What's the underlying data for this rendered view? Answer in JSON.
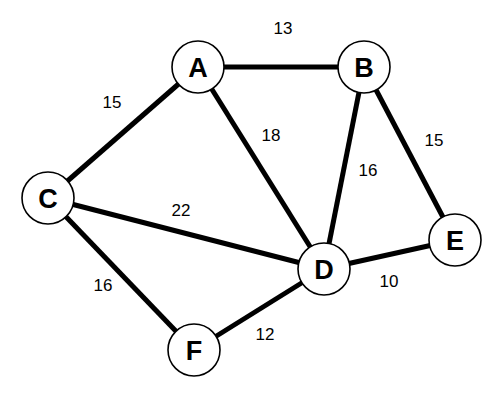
{
  "diagram": {
    "type": "weighted-undirected-graph",
    "node_radius": 26,
    "nodes": [
      {
        "id": "A",
        "label": "A",
        "x": 198,
        "y": 67
      },
      {
        "id": "B",
        "label": "B",
        "x": 364,
        "y": 67
      },
      {
        "id": "C",
        "label": "C",
        "x": 48,
        "y": 198
      },
      {
        "id": "D",
        "label": "D",
        "x": 324,
        "y": 269
      },
      {
        "id": "E",
        "label": "E",
        "x": 455,
        "y": 240
      },
      {
        "id": "F",
        "label": "F",
        "x": 194,
        "y": 350
      }
    ],
    "edges": [
      {
        "from": "A",
        "to": "B",
        "weight": "13",
        "label_x": 283,
        "label_y": 28
      },
      {
        "from": "A",
        "to": "C",
        "weight": "15",
        "label_x": 112,
        "label_y": 102
      },
      {
        "from": "A",
        "to": "D",
        "weight": "18",
        "label_x": 271,
        "label_y": 135
      },
      {
        "from": "B",
        "to": "D",
        "weight": "16",
        "label_x": 368,
        "label_y": 170
      },
      {
        "from": "B",
        "to": "E",
        "weight": "15",
        "label_x": 434,
        "label_y": 140
      },
      {
        "from": "C",
        "to": "D",
        "weight": "22",
        "label_x": 181,
        "label_y": 210
      },
      {
        "from": "C",
        "to": "F",
        "weight": "16",
        "label_x": 103,
        "label_y": 285
      },
      {
        "from": "D",
        "to": "E",
        "weight": "10",
        "label_x": 389,
        "label_y": 281
      },
      {
        "from": "D",
        "to": "F",
        "weight": "12",
        "label_x": 265,
        "label_y": 334
      }
    ]
  }
}
